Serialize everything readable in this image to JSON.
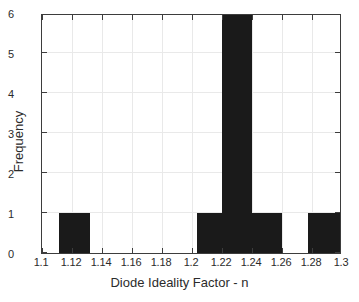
{
  "chart_data": {
    "type": "bar",
    "title": "",
    "subtitle": "",
    "xlabel": "Diode Ideality Factor - n",
    "ylabel": "Frequency",
    "xlim": [
      1.1,
      1.3
    ],
    "ylim": [
      0,
      6
    ],
    "grid": true,
    "legend": null,
    "xticks": [
      1.1,
      1.12,
      1.14,
      1.16,
      1.18,
      1.2,
      1.22,
      1.24,
      1.26,
      1.28,
      1.3
    ],
    "xticklabels": [
      "1.1",
      "1.12",
      "1.14",
      "1.16",
      "1.18",
      "1.2",
      "1.22",
      "1.24",
      "1.26",
      "1.28",
      "1.3"
    ],
    "yticks": [
      0,
      1,
      2,
      3,
      4,
      5,
      6
    ],
    "yticklabels": [
      "0",
      "1",
      "2",
      "3",
      "4",
      "5",
      "6"
    ],
    "bar_color": "#1a1a1a",
    "bins": [
      {
        "x0": 1.1113,
        "x1": 1.132,
        "count": 1
      },
      {
        "x0": 1.2033,
        "x1": 1.22,
        "count": 1
      },
      {
        "x0": 1.22,
        "x1": 1.24,
        "count": 6
      },
      {
        "x0": 1.24,
        "x1": 1.26,
        "count": 1
      },
      {
        "x0": 1.2773,
        "x1": 1.3,
        "count": 1
      }
    ],
    "categories": [
      "1.1113-1.1320",
      "1.2033-1.2200",
      "1.2200-1.2400",
      "1.2400-1.2600",
      "1.2773-1.3000"
    ],
    "values": [
      1,
      1,
      6,
      1,
      1
    ]
  }
}
